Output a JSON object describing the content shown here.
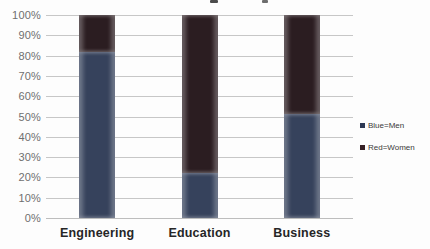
{
  "chart_data": {
    "type": "bar",
    "subtype": "stacked-100-percent",
    "title": "",
    "categories": [
      "Engineering",
      "Education",
      "Business"
    ],
    "series": [
      {
        "name": "Men",
        "color": "#36425c",
        "values": [
          82,
          22,
          51
        ]
      },
      {
        "name": "Women",
        "color": "#2b1d21",
        "values": [
          18,
          78,
          49
        ]
      }
    ],
    "y_ticks": [
      "100%",
      "90%",
      "80%",
      "70%",
      "60%",
      "50%",
      "40%",
      "30%",
      "20%",
      "10%",
      "0%"
    ],
    "ylim": [
      0,
      100
    ],
    "grid": true,
    "legend": {
      "position": "right",
      "entries": [
        {
          "label": "Blue=Men",
          "marker_color": "#2c3854"
        },
        {
          "label": "Red=Women",
          "marker_color": "#352025"
        }
      ]
    }
  },
  "colors": {
    "background": "#fdfdfd",
    "gridline": "#c7c7c7",
    "axis_label_text": "#6f6f6f",
    "category_label_text": "#262626",
    "legend_text": "#3a3a3a"
  }
}
